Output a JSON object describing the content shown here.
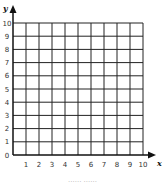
{
  "grid": {
    "x_axis_label": "x",
    "y_axis_label": "y",
    "x_ticks": [
      "1",
      "2",
      "3",
      "4",
      "5",
      "6",
      "7",
      "8",
      "9",
      "10"
    ],
    "y_ticks": [
      "0",
      "1",
      "2",
      "3",
      "4",
      "5",
      "6",
      "7",
      "8",
      "9",
      "10"
    ],
    "x_range": [
      0,
      10
    ],
    "y_range": [
      0,
      10
    ],
    "line_color": "#222222"
  },
  "caption": "...... ......"
}
